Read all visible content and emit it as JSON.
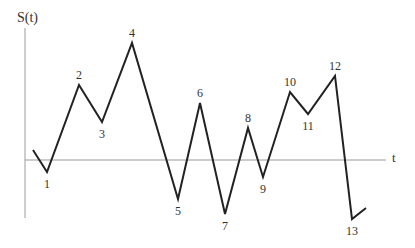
{
  "diagram": {
    "y_axis_label": "S(t)",
    "x_axis_label": "t",
    "colors": {
      "axis": "#9a9a9a",
      "line": "#222222",
      "text": "#333333"
    },
    "axes": {
      "y_axis": {
        "x": 25,
        "y1": 28,
        "y2": 218
      },
      "x_axis": {
        "y": 160,
        "x1": 25,
        "x2": 386
      }
    },
    "path": {
      "start": [
        33,
        150
      ],
      "end": [
        366,
        208
      ]
    },
    "vertices": [
      {
        "label": "1",
        "x": 47,
        "y": 172,
        "label_pos": "below"
      },
      {
        "label": "2",
        "x": 79,
        "y": 85,
        "label_pos": "above"
      },
      {
        "label": "3",
        "x": 102,
        "y": 122,
        "label_pos": "below"
      },
      {
        "label": "4",
        "x": 132,
        "y": 43,
        "label_pos": "above"
      },
      {
        "label": "5",
        "x": 178,
        "y": 199,
        "label_pos": "below"
      },
      {
        "label": "6",
        "x": 200,
        "y": 103,
        "label_pos": "above"
      },
      {
        "label": "7",
        "x": 225,
        "y": 214,
        "label_pos": "below"
      },
      {
        "label": "8",
        "x": 248,
        "y": 128,
        "label_pos": "above"
      },
      {
        "label": "9",
        "x": 263,
        "y": 177,
        "label_pos": "below"
      },
      {
        "label": "10",
        "x": 290,
        "y": 92,
        "label_pos": "above"
      },
      {
        "label": "11",
        "x": 308,
        "y": 114,
        "label_pos": "below"
      },
      {
        "label": "12",
        "x": 335,
        "y": 76,
        "label_pos": "above"
      },
      {
        "label": "13",
        "x": 352,
        "y": 219,
        "label_pos": "below"
      }
    ]
  }
}
